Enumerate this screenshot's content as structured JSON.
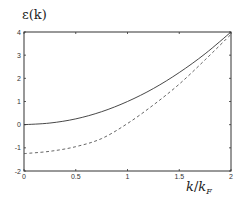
{
  "chart_data": {
    "type": "line",
    "title": "",
    "xlabel": "k/k_F",
    "ylabel": "ε(k)",
    "xlim": [
      0,
      2
    ],
    "ylim": [
      -2,
      4
    ],
    "xticks": [
      0,
      0.5,
      1,
      1.5,
      2
    ],
    "xtick_labels": [
      "0",
      "0.5",
      "1",
      "1.5",
      "2"
    ],
    "yticks": [
      -2,
      -1,
      0,
      1,
      2,
      3,
      4
    ],
    "ytick_labels": [
      "-2",
      "-1",
      "0",
      "1",
      "2",
      "3",
      "4"
    ],
    "grid": false,
    "legend": null,
    "x": [
      0,
      0.25,
      0.5,
      0.75,
      1.0,
      1.25,
      1.5,
      1.75,
      2.0
    ],
    "series": [
      {
        "name": "solid",
        "style": "solid",
        "color": "#333333",
        "values": [
          0,
          0.07,
          0.25,
          0.56,
          1.0,
          1.56,
          2.25,
          3.06,
          4.0
        ]
      },
      {
        "name": "dashed",
        "style": "dashed",
        "color": "#555555",
        "values": [
          -1.25,
          -1.15,
          -0.95,
          -0.6,
          0.05,
          0.85,
          1.75,
          2.8,
          3.9
        ]
      }
    ]
  },
  "labels": {
    "ylabel_text": "ε(k)",
    "xlabel_k": "k",
    "xlabel_slash": "/",
    "xlabel_kF": "k",
    "xlabel_sub": "F"
  }
}
